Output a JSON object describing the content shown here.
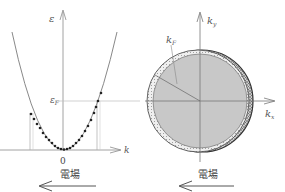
{
  "left_panel": {
    "y_axis_label": "ε",
    "fermi_label": "ε",
    "fermi_sub": "F",
    "x_axis_label": "k",
    "origin_label": "0",
    "field_label": "電場"
  },
  "right_panel": {
    "y_axis_label": "k",
    "y_axis_sub": "y",
    "x_axis_label": "k",
    "x_axis_sub": "x",
    "radius_label": "k",
    "radius_sub": "F",
    "field_label": "電場"
  },
  "colors": {
    "line": "#8a8a8a",
    "curve": "#7a7a7a",
    "dot": "#222222",
    "sphere_fill": "#c8c8c8",
    "shell_fill": "#e6e6e6",
    "stipple": "#333333"
  }
}
